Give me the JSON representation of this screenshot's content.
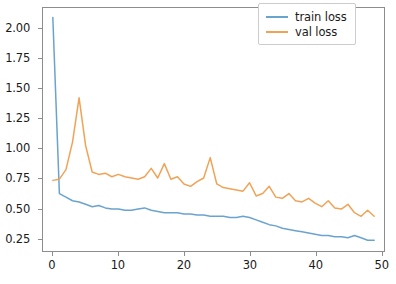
{
  "chart_data": {
    "type": "line",
    "title": "",
    "xlabel": "",
    "ylabel": "",
    "xlim": [
      -1.5,
      50.5
    ],
    "ylim": [
      0.14,
      2.17
    ],
    "grid": false,
    "legend_position": "upper right",
    "xticks": [
      "0",
      "10",
      "20",
      "30",
      "40",
      "50"
    ],
    "xtick_values": [
      0,
      10,
      20,
      30,
      40,
      50
    ],
    "yticks": [
      "0.25",
      "0.50",
      "0.75",
      "1.00",
      "1.25",
      "1.50",
      "1.75",
      "2.00"
    ],
    "ytick_values": [
      0.25,
      0.5,
      0.75,
      1.0,
      1.25,
      1.5,
      1.75,
      2.0
    ],
    "x": [
      0,
      1,
      2,
      3,
      4,
      5,
      6,
      7,
      8,
      9,
      10,
      11,
      12,
      13,
      14,
      15,
      16,
      17,
      18,
      19,
      20,
      21,
      22,
      23,
      24,
      25,
      26,
      27,
      28,
      29,
      30,
      31,
      32,
      33,
      34,
      35,
      36,
      37,
      38,
      39,
      40,
      41,
      42,
      43,
      44,
      45,
      46,
      47,
      48,
      49
    ],
    "series": [
      {
        "name": "train loss",
        "color": "#6ba3cf",
        "values": [
          2.09,
          0.62,
          0.59,
          0.56,
          0.55,
          0.53,
          0.51,
          0.52,
          0.5,
          0.49,
          0.49,
          0.48,
          0.48,
          0.49,
          0.5,
          0.48,
          0.47,
          0.46,
          0.46,
          0.46,
          0.45,
          0.45,
          0.44,
          0.44,
          0.43,
          0.43,
          0.43,
          0.42,
          0.42,
          0.43,
          0.42,
          0.4,
          0.38,
          0.36,
          0.35,
          0.33,
          0.32,
          0.31,
          0.3,
          0.29,
          0.28,
          0.27,
          0.27,
          0.26,
          0.26,
          0.25,
          0.27,
          0.25,
          0.23,
          0.23
        ]
      },
      {
        "name": "val loss",
        "color": "#f0a357",
        "values": [
          0.73,
          0.74,
          0.82,
          1.05,
          1.42,
          1.02,
          0.8,
          0.78,
          0.79,
          0.76,
          0.78,
          0.76,
          0.75,
          0.74,
          0.76,
          0.83,
          0.75,
          0.87,
          0.74,
          0.76,
          0.7,
          0.68,
          0.72,
          0.75,
          0.92,
          0.7,
          0.67,
          0.66,
          0.65,
          0.64,
          0.71,
          0.6,
          0.62,
          0.68,
          0.59,
          0.58,
          0.62,
          0.56,
          0.55,
          0.58,
          0.54,
          0.51,
          0.56,
          0.5,
          0.49,
          0.53,
          0.46,
          0.43,
          0.48,
          0.43
        ]
      }
    ]
  },
  "legend": {
    "items": [
      {
        "label": "train loss"
      },
      {
        "label": "val loss"
      }
    ]
  }
}
